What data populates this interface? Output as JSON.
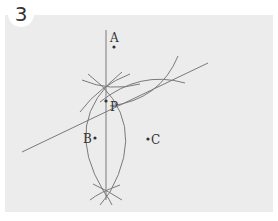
{
  "problem_number": "3",
  "colors": {
    "panel": "#ececec",
    "line": "#7a7a7a",
    "text": "#333333"
  },
  "points": {
    "A": {
      "label": "A",
      "x": 114,
      "y": 47
    },
    "B": {
      "label": "B",
      "x": 95,
      "y": 138
    },
    "C": {
      "label": "C",
      "x": 148,
      "y": 139
    },
    "P": {
      "label": "P",
      "x": 106,
      "y": 101
    }
  }
}
